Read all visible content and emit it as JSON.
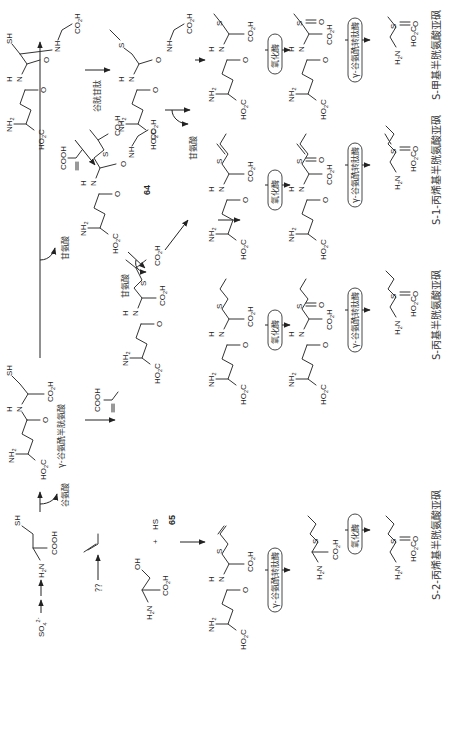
{
  "diagram": {
    "type": "biosynthesis-pathway",
    "orientation": "rotated-90-ccw",
    "colors": {
      "line": "#333333",
      "text": "#222222",
      "background": "#ffffff"
    },
    "start": {
      "sulfate": "SO",
      "sulfate_sub": "4",
      "sulfate_sup": "2-"
    },
    "atoms": {
      "SH": "SH",
      "S": "S",
      "NH": "NH",
      "NH2": "NH",
      "H2N": "H",
      "N": "N",
      "H": "H",
      "O": "O",
      "OH": "OH",
      "HS": "HS",
      "COOH": "COOH",
      "CO2H": "CO",
      "HO2C": "HO",
      "sub2": "2",
      "C": "C"
    },
    "reagents": {
      "glutamate": "谷氨酸",
      "glycine_1": "甘氨酸",
      "glycine_2": "甘氨酸",
      "glycine_3": "甘氨酸",
      "glutathione": "谷胱甘肽",
      "gamma_glutamylcysteine": "γ-谷氨酰半胱氨酸",
      "methacrylic_acid": "COOH",
      "methacrylic_acid_2": "COOH",
      "unknown": "??"
    },
    "compound_numbers": {
      "c64": "64",
      "c65": "65"
    },
    "enzymes": {
      "oxidase": "氧化酶",
      "transpeptidase": "γ-谷氨酰转肽酶"
    },
    "final_products": [
      {
        "id": "methyl",
        "label": "S-甲基半胱氨酸亚砜"
      },
      {
        "id": "propenyl-1",
        "label": "S-1-丙烯基半胱氨酸亚砜"
      },
      {
        "id": "propyl",
        "label": "S-丙基半胱氨酸亚砜"
      },
      {
        "id": "propenyl-2",
        "label": "S-2-丙烯基半胱氨酸亚砜"
      }
    ],
    "plus_sign": "+"
  }
}
